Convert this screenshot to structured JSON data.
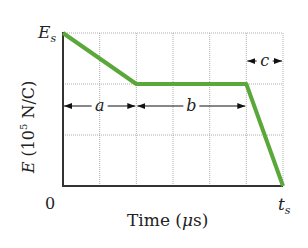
{
  "chart_data": {
    "type": "line",
    "title": "",
    "xlabel": "Time (μs)",
    "ylabel": "E (10^5 N/C)",
    "ylabel_parts": {
      "var": "E",
      "open": " (10",
      "sup": "5",
      "close": " N/C)"
    },
    "xlabel_parts": {
      "text": "Time (",
      "mu": "μ",
      "close": "s)"
    },
    "x_tick_labels": {
      "origin": "0",
      "end": "t",
      "end_sub": "s"
    },
    "y_tick_labels": {
      "top": "E",
      "top_sub": "s"
    },
    "grid": true,
    "grid_divisions": {
      "x": 6,
      "y": 3
    },
    "x": [
      0,
      2,
      5,
      6
    ],
    "y": [
      3,
      2,
      2,
      0
    ],
    "xlim": [
      0,
      6
    ],
    "ylim": [
      0,
      3
    ],
    "line_color": "#5aa83a",
    "intervals": [
      {
        "label": "a",
        "x_start": 0,
        "x_end": 2
      },
      {
        "label": "b",
        "x_start": 2,
        "x_end": 5
      },
      {
        "label": "c",
        "x_start": 5,
        "x_end": 6
      }
    ],
    "annotations": [
      "a",
      "b",
      "c"
    ]
  }
}
